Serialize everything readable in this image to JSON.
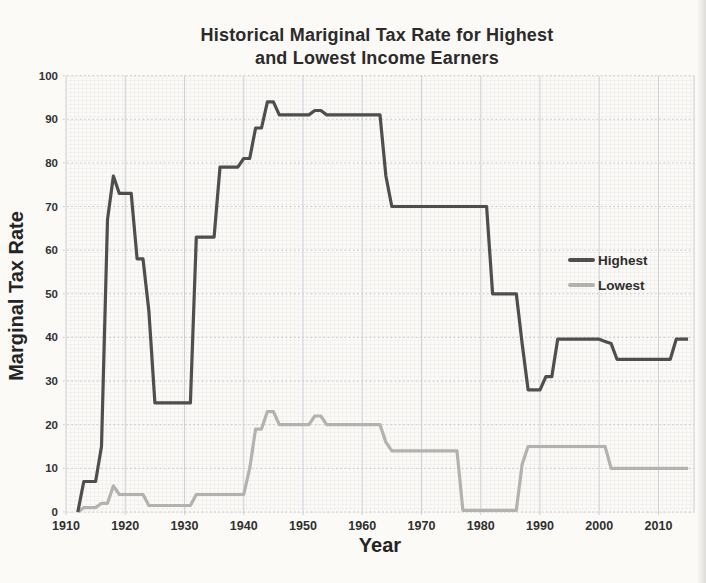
{
  "title": {
    "line1": "Historical Mariginal Tax Rate for Highest",
    "line2": "and Lowest Income Earners"
  },
  "chart_data": {
    "type": "line",
    "title": "Historical Mariginal Tax Rate for Highest and Lowest Income Earners",
    "xlabel": "Year",
    "ylabel": "Marginal Tax Rate",
    "xlim": [
      1910,
      2016
    ],
    "ylim": [
      0,
      100
    ],
    "x_ticks": [
      1910,
      1920,
      1930,
      1940,
      1950,
      1960,
      1970,
      1980,
      1990,
      2000,
      2010
    ],
    "y_ticks": [
      0,
      10,
      20,
      30,
      40,
      50,
      60,
      70,
      80,
      90,
      100
    ],
    "grid": true,
    "legend_position": "right-middle",
    "series": [
      {
        "name": "Highest",
        "color": "#4e4e4e",
        "points": [
          [
            1912,
            0
          ],
          [
            1913,
            7
          ],
          [
            1915,
            7
          ],
          [
            1916,
            15
          ],
          [
            1917,
            67
          ],
          [
            1918,
            77
          ],
          [
            1919,
            73
          ],
          [
            1921,
            73
          ],
          [
            1922,
            58
          ],
          [
            1923,
            58
          ],
          [
            1924,
            46
          ],
          [
            1925,
            25
          ],
          [
            1931,
            25
          ],
          [
            1932,
            63
          ],
          [
            1935,
            63
          ],
          [
            1936,
            79
          ],
          [
            1939,
            79
          ],
          [
            1940,
            81
          ],
          [
            1941,
            81
          ],
          [
            1942,
            88
          ],
          [
            1943,
            88
          ],
          [
            1944,
            94
          ],
          [
            1945,
            94
          ],
          [
            1946,
            91
          ],
          [
            1951,
            91
          ],
          [
            1952,
            92
          ],
          [
            1953,
            92
          ],
          [
            1954,
            91
          ],
          [
            1963,
            91
          ],
          [
            1964,
            77
          ],
          [
            1965,
            70
          ],
          [
            1981,
            70
          ],
          [
            1982,
            50
          ],
          [
            1986,
            50
          ],
          [
            1987,
            38.5
          ],
          [
            1988,
            28
          ],
          [
            1990,
            28
          ],
          [
            1991,
            31
          ],
          [
            1992,
            31
          ],
          [
            1993,
            39.6
          ],
          [
            2000,
            39.6
          ],
          [
            2001,
            39.1
          ],
          [
            2002,
            38.6
          ],
          [
            2003,
            35
          ],
          [
            2012,
            35
          ],
          [
            2013,
            39.6
          ],
          [
            2015,
            39.6
          ]
        ]
      },
      {
        "name": "Lowest",
        "color": "#b4b2af",
        "points": [
          [
            1912,
            0
          ],
          [
            1913,
            1
          ],
          [
            1915,
            1
          ],
          [
            1916,
            2
          ],
          [
            1917,
            2
          ],
          [
            1918,
            6
          ],
          [
            1919,
            4
          ],
          [
            1923,
            4
          ],
          [
            1924,
            1.5
          ],
          [
            1931,
            1.5
          ],
          [
            1932,
            4
          ],
          [
            1940,
            4
          ],
          [
            1941,
            10
          ],
          [
            1942,
            19
          ],
          [
            1943,
            19
          ],
          [
            1944,
            23
          ],
          [
            1945,
            23
          ],
          [
            1946,
            20
          ],
          [
            1951,
            20
          ],
          [
            1952,
            22
          ],
          [
            1953,
            22
          ],
          [
            1954,
            20
          ],
          [
            1963,
            20
          ],
          [
            1964,
            16
          ],
          [
            1965,
            14
          ],
          [
            1976,
            14
          ],
          [
            1977,
            0.4
          ],
          [
            1986,
            0.4
          ],
          [
            1987,
            11
          ],
          [
            1988,
            15
          ],
          [
            2001,
            15
          ],
          [
            2002,
            10
          ],
          [
            2015,
            10
          ]
        ]
      }
    ]
  }
}
